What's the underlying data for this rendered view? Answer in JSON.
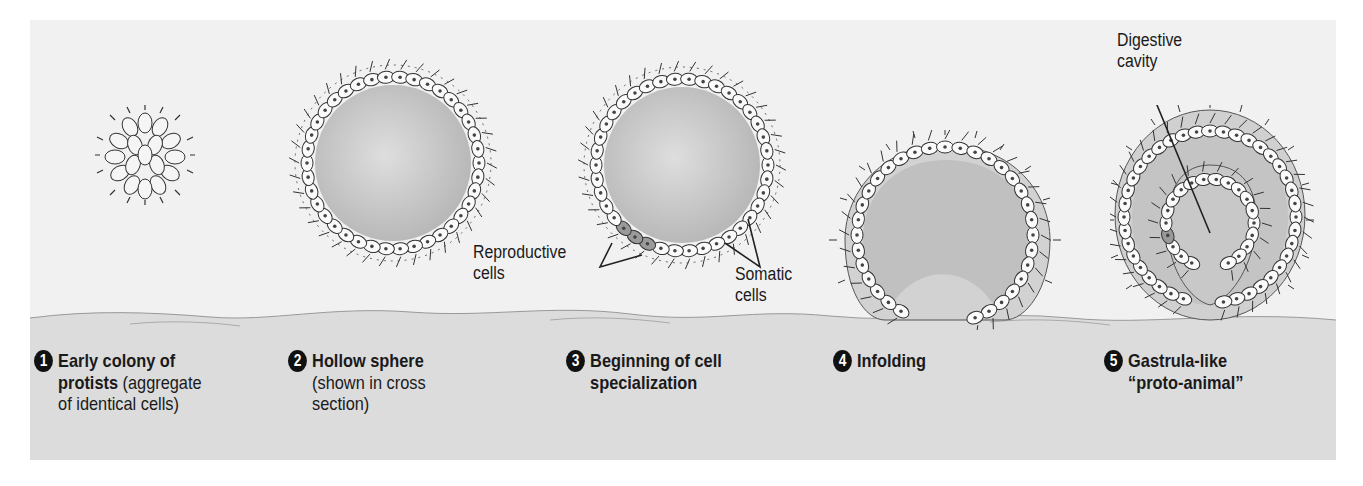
{
  "diagram": {
    "stages": [
      {
        "number": "1",
        "title_bold_1": "Early colony of",
        "title_bold_2": "protists",
        "desc_1": " (aggregate",
        "desc_2": "of identical cells)"
      },
      {
        "number": "2",
        "title_bold": "Hollow sphere",
        "desc_1": "(shown in cross",
        "desc_2": "section)"
      },
      {
        "number": "3",
        "title_bold_1": "Beginning of cell",
        "title_bold_2": "specialization"
      },
      {
        "number": "4",
        "title_bold": "Infolding"
      },
      {
        "number": "5",
        "title_bold_1": "Gastrula-like",
        "title_bold_2": "“proto-animal”"
      }
    ],
    "callouts": {
      "reproductive_1": "Reproductive",
      "reproductive_2": "cells",
      "somatic_1": "Somatic",
      "somatic_2": "cells",
      "digestive_1": "Digestive",
      "digestive_2": "cavity"
    }
  },
  "colors": {
    "background": "#f1f1f1",
    "ground": "#dcdcdc",
    "cell_fill": "#fafafa",
    "cell_outline": "#333333",
    "interior": "#c8c8c8",
    "reproductive_cell": "#9a9a9a"
  }
}
